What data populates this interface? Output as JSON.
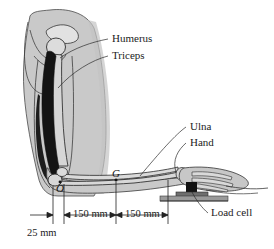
{
  "figure": {
    "type": "anatomical-biomechanics-diagram",
    "background_color": "#ffffff",
    "ink_color": "#1c1c1c",
    "body_fill_color": "#c9c9c9",
    "muscle_fill_color": "#141414",
    "bone_fill_color": "#d8d8d8",
    "platform_color": "#9a9a9a"
  },
  "labels": {
    "humerus": "Humerus",
    "triceps": "Triceps",
    "ulna": "Ulna",
    "hand": "Hand",
    "load_cell": "Load cell"
  },
  "points": {
    "center_of_gravity": "G",
    "elbow_origin": "O"
  },
  "dimensions": {
    "upper": "25 mm",
    "segment_one": "150 mm",
    "segment_two": "150 mm"
  }
}
